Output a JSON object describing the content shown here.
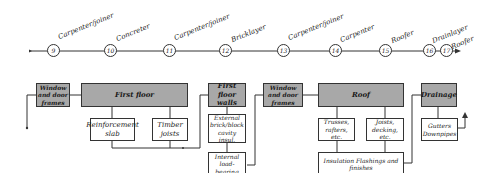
{
  "timeline": {
    "nodes": [
      {
        "num": "9",
        "label": "Carpenter/joiner"
      },
      {
        "num": "10",
        "label": "Concreter"
      },
      {
        "num": "11",
        "label": "Carpenter/joiner"
      },
      {
        "num": "12",
        "label": "Bricklayer"
      },
      {
        "num": "13",
        "label": "Carpenter/joiner"
      },
      {
        "num": "14",
        "label": "Carpenter"
      },
      {
        "num": "15",
        "label": "Roofer"
      },
      {
        "num": "16",
        "label": "Drainlayer"
      },
      {
        "num": "17",
        "label": "Roofer"
      }
    ]
  },
  "boxes": {
    "window_door_1": "Window and door frames",
    "first_floor": "First floor",
    "reinforcement_slab": "Reinforcement slab",
    "timber_joists": "Timber joists",
    "first_floor_walls": "First floor walls",
    "external_brick": "External brick/block cavity insul.",
    "internal_load": "Internal load-bearing",
    "window_door_2": "Window and door frames",
    "roof": "Roof",
    "trusses": "Trusses, rafters, etc.",
    "joists_decking": "Joists, decking, etc.",
    "insulation": "Insulation Flashings and finishes",
    "drainage": "Drainage",
    "gutters": "Gutters Downpipes"
  },
  "colors": {
    "shaded_box": "#a8a8a8",
    "line": "#333333"
  }
}
